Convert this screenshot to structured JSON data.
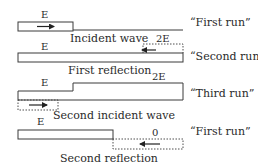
{
  "rows": [
    {
      "energy_label": "E",
      "caption": "Incident wave",
      "run_label": "“First run”"
    },
    {
      "energy_label": "E",
      "dotted_label": "2E",
      "caption": "First reflection",
      "run_label": "“Second run”"
    },
    {
      "energy_label": "E",
      "step_label": "2E",
      "caption": "Second incident wave",
      "run_label": "“Third run”"
    },
    {
      "energy_label": "E",
      "dotted_label": "0",
      "caption": "Second reflection",
      "run_label": "“First run”"
    }
  ],
  "colors": {
    "stroke": "#3a3a3a",
    "text": "#2a2a2a"
  }
}
